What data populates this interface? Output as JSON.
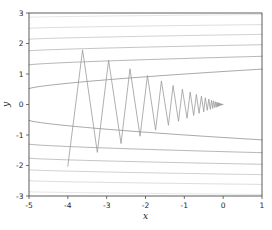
{
  "figure": {
    "width": 272,
    "height": 230,
    "background": "#ffffff"
  },
  "chart_data": {
    "type": "line",
    "title": "",
    "subtitle": "",
    "xlabel": "x",
    "ylabel": "y",
    "xlim": [
      -5,
      1
    ],
    "ylim": [
      -3,
      3
    ],
    "xticks": [
      -5,
      -4,
      -3,
      -2,
      -1,
      0,
      1
    ],
    "xticklabels": [
      "-5",
      "-4",
      "-3",
      "-2",
      "-1",
      "0",
      "1"
    ],
    "yticks": [
      -3,
      -2,
      -1,
      0,
      1,
      2,
      3
    ],
    "yticklabels": [
      "-3",
      "-2",
      "-1",
      "0",
      "1",
      "2",
      "3"
    ],
    "grid": false,
    "legend": null,
    "legend_position": "none",
    "annotations": [],
    "series": [
      {
        "name": "gradient-descent-trajectory",
        "type": "line",
        "color": "#9a9a9a",
        "linewidth": 0.8,
        "x": [
          -4.0,
          -3.62,
          -3.24,
          -2.95,
          -2.63,
          -2.4,
          -2.14,
          -1.95,
          -1.74,
          -1.59,
          -1.41,
          -1.29,
          -1.15,
          -1.05,
          -0.93,
          -0.85,
          -0.76,
          -0.69,
          -0.62,
          -0.56,
          -0.5,
          -0.46,
          -0.41,
          -0.37,
          -0.33,
          -0.3,
          -0.27,
          -0.25,
          -0.22,
          -0.2,
          -0.18,
          -0.16,
          -0.15,
          -0.13,
          -0.12,
          -0.11,
          -0.1,
          -0.09,
          -0.08,
          -0.07,
          -0.06,
          -0.05,
          -0.04,
          -0.03,
          -0.02,
          -0.01,
          0.0
        ],
        "y": [
          -2.02,
          1.79,
          -1.57,
          1.45,
          -1.28,
          1.17,
          -1.04,
          0.95,
          -0.84,
          0.77,
          -0.68,
          0.62,
          -0.55,
          0.5,
          -0.45,
          0.41,
          -0.36,
          0.33,
          -0.29,
          0.27,
          -0.24,
          0.22,
          -0.19,
          0.18,
          -0.16,
          0.14,
          -0.13,
          0.12,
          -0.1,
          0.09,
          -0.09,
          0.08,
          -0.07,
          0.06,
          -0.06,
          0.05,
          -0.04,
          0.04,
          -0.03,
          0.03,
          -0.03,
          0.02,
          -0.02,
          0.02,
          -0.01,
          0.01,
          0.0
        ]
      },
      {
        "name": "objective-contours",
        "type": "contour",
        "color_range": [
          "#d8d8d8",
          "#8c8c8c"
        ],
        "linewidth": 0.7,
        "description": "Nested elongated level sets of a quadratic-like objective opening to the right; curves run nearly horizontally across the axes and bend upward toward negative x.",
        "levels_left_edge_y": [
          2.86,
          2.5,
          2.14,
          1.76,
          1.3,
          0.52,
          -0.52,
          -1.3,
          -1.76,
          -2.14,
          -2.5,
          -2.86
        ],
        "levels_right_edge_y": [
          2.95,
          2.62,
          2.3,
          1.96,
          1.58,
          1.16,
          -1.16,
          -1.58,
          -1.96,
          -2.3,
          -2.62,
          -2.95
        ]
      }
    ]
  },
  "axes": {
    "x_axis_name": "x-axis",
    "y_axis_name": "y-axis"
  }
}
